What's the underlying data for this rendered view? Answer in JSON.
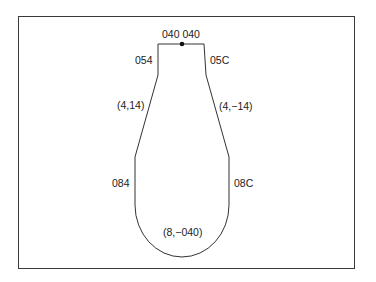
{
  "diagram": {
    "type": "tool-path-profile",
    "labels": {
      "top": "040 040",
      "left_upper": "054",
      "right_upper": "05C",
      "left_taper": "(4,14)",
      "right_taper": "(4,−14)",
      "left_lower": "084",
      "right_lower": "08C",
      "bottom_arc": "(8,−040)"
    },
    "colors": {
      "stroke": "#333333",
      "frame": "#3a3a3a",
      "text": "#222222",
      "background": "#ffffff"
    },
    "points": {
      "top_left": [
        158,
        44
      ],
      "top_right": [
        204,
        44
      ],
      "start_dot": [
        182,
        44
      ],
      "left_neck_bottom": [
        158,
        75
      ],
      "right_neck_bottom": [
        206,
        75
      ],
      "left_taper_bottom": [
        135,
        157
      ],
      "right_taper_bottom": [
        229,
        157
      ],
      "left_wall_bottom": [
        135,
        205
      ],
      "right_wall_bottom": [
        229,
        205
      ],
      "arc_bottom": [
        182,
        257
      ]
    }
  }
}
